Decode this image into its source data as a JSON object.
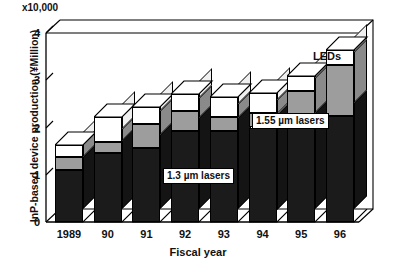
{
  "chart_data": {
    "type": "bar",
    "stacked": true,
    "title": "",
    "subtitle": "",
    "xlabel": "Fiscal year",
    "ylabel": "InP-based device production (¥Million)",
    "y_multiplier": "x10,000",
    "ylim": [
      0,
      4
    ],
    "yticks": [
      0,
      1,
      2,
      3,
      4
    ],
    "ytick_labels": [
      "0",
      "1",
      "2",
      "3",
      "4"
    ],
    "grid": false,
    "legend_position": "inline-annotations",
    "categories": [
      "1989",
      "90",
      "91",
      "92",
      "93",
      "94",
      "95",
      "96"
    ],
    "series": [
      {
        "name": "1.3 µm lasers",
        "color": "#1b1b1b",
        "values": [
          1.1,
          1.45,
          1.57,
          1.93,
          1.93,
          2.0,
          2.03,
          2.25
        ]
      },
      {
        "name": "1.55 µm lasers",
        "color": "#9d9d9d",
        "values": [
          0.28,
          0.25,
          0.51,
          0.42,
          0.29,
          0.3,
          0.75,
          1.08
        ]
      },
      {
        "name": "LEDs",
        "color": "#ffffff",
        "values": [
          0.24,
          0.53,
          0.35,
          0.35,
          0.43,
          0.42,
          0.32,
          0.32
        ]
      }
    ],
    "cumulative_tops": [
      1.62,
      2.23,
      2.43,
      2.7,
      2.65,
      2.72,
      3.1,
      3.65
    ],
    "annotations": [
      {
        "text": "1.3 µm lasers",
        "boxed": true,
        "x_frac": 0.44,
        "y_value": 0.88
      },
      {
        "text": "1.55 µm lasers",
        "boxed": true,
        "x_frac": 0.72,
        "y_value": 2.4
      },
      {
        "text": "LEDs",
        "boxed": false,
        "x_frac": 0.9,
        "y_value": 3.42
      }
    ]
  },
  "axis": {
    "multiplier_label": "x10,000",
    "y_title": "InP-based device production (¥Million)",
    "x_title": "Fiscal year",
    "y_tick_labels": [
      "4",
      "3",
      "2",
      "1",
      "0"
    ],
    "x_tick_labels": [
      "1989",
      "90",
      "91",
      "92",
      "93",
      "94",
      "95",
      "96"
    ]
  },
  "annotations": {
    "lasers_13": "1.3 µm lasers",
    "lasers_155": "1.55 µm lasers",
    "leds": "LEDs"
  },
  "colors": {
    "series_13um": "#1b1b1b",
    "series_155um": "#9d9d9d",
    "series_leds": "#ffffff",
    "axis": "#000000",
    "background": "#ffffff"
  }
}
